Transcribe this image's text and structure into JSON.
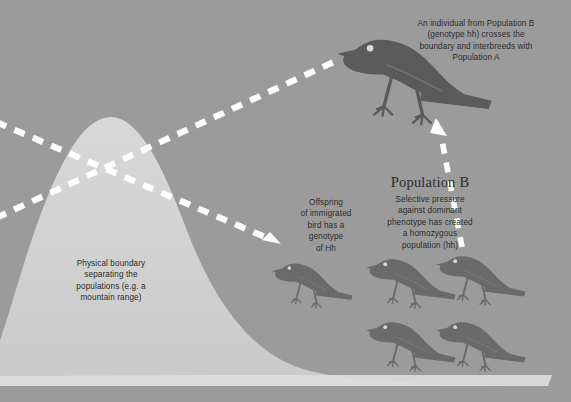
{
  "figure": {
    "title_hidden": "",
    "background_color": "#9b9b9b",
    "mountain_color": "#cfcfcf",
    "ground_color": "#d6d6d6",
    "bird_color": "#6f6f6f",
    "bird_dark_color": "#5e5e5e",
    "arrow_color": "#ffffff",
    "text_color": "#2b2b2b"
  },
  "annotations": {
    "top_right": "An individual from Population B\n(genotype hh) crosses the\nboundary and interbreeds with\nPopulation A",
    "boundary": "Physical boundary\nseparating the\npopulations (e.g. a\nmountain range)",
    "offspring": "Offspring\nof immigrated\nbird has a\ngenotype\nof Hh",
    "population_b_heading": "Population B",
    "population_b_body": "Selective pressure\nagainst dominant\nphenotype has created\na homozygous\npopulation (hh)"
  },
  "birds": {
    "migrant_label": "migrant-bird-large",
    "offspring_label": "offspring-bird",
    "population_b_count": 4
  },
  "arrows": {
    "upper_left_to_bird": "dashed-arrow-to-migrant-bird",
    "lower_left_to_offspring": "dashed-arrow-to-offspring",
    "right_up_to_bird": "dashed-arrow-population-b-to-migrant"
  }
}
